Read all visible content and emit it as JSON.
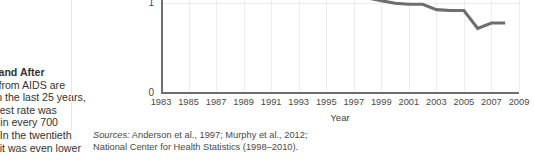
{
  "caption": {
    "lines": [
      {
        "text": "Before and After",
        "bold": true
      },
      {
        "text": "Deaths from AIDS are",
        "bold": false
      },
      {
        "text": "down. In the last 25 years,",
        "bold": false
      },
      {
        "text": "the highest rate was",
        "bold": false
      },
      {
        "text": "about 1 in every 700",
        "bold": false
      },
      {
        "text": "people. In the twentieth",
        "bold": false
      },
      {
        "text": "century it was even lower",
        "bold": false
      }
    ]
  },
  "sources": {
    "label": "Sources:",
    "line1": " Anderson et al., 1997; Murphy et al., 2012;",
    "line2": "National Center for Health Statistics (1998–2010)."
  },
  "chart_data": {
    "type": "line",
    "title": "",
    "xlabel": "Year",
    "ylabel": "",
    "grid": true,
    "legend": "none",
    "xlim": [
      1983,
      2009
    ],
    "ylim": [
      0,
      1.55
    ],
    "yticks": [
      "0",
      "1"
    ],
    "ytick_values": [
      0,
      1
    ],
    "xticks": [
      "1983",
      "1985",
      "1987",
      "1989",
      "1991",
      "1993",
      "1995",
      "1997",
      "1999",
      "2001",
      "2003",
      "2005",
      "2007",
      "2009"
    ],
    "xtick_values": [
      1983,
      1985,
      1987,
      1989,
      1991,
      1993,
      1995,
      1997,
      1999,
      2001,
      2003,
      2005,
      2007,
      2009
    ],
    "line_color": "#6e6e6e",
    "x": [
      1992,
      1993,
      1994,
      1995,
      1996,
      1997,
      1998,
      1999,
      2000,
      2001,
      2002,
      2003,
      2004,
      2005,
      2006,
      2007,
      2008
    ],
    "values": [
      1.53,
      1.52,
      1.4,
      1.28,
      1.16,
      1.14,
      1.06,
      1.03,
      1.0,
      0.99,
      0.99,
      0.93,
      0.92,
      0.92,
      0.72,
      0.78,
      0.78
    ],
    "series": [
      {
        "name": "AIDS death rate",
        "values": [
          1.53,
          1.52,
          1.4,
          1.28,
          1.16,
          1.14,
          1.06,
          1.03,
          1.0,
          0.99,
          0.99,
          0.93,
          0.92,
          0.92,
          0.72,
          0.78,
          0.78
        ]
      }
    ]
  }
}
